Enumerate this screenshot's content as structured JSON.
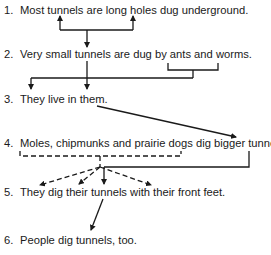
{
  "sentences": [
    {
      "number": "1.",
      "text": "Most tunnels are long holes dug underground."
    },
    {
      "number": "2.",
      "text": "Very small tunnels are dug by ants and worms."
    },
    {
      "number": "3.",
      "text": "They live in them."
    },
    {
      "number": "4.",
      "text": "Moles, chipmunks and prairie dogs dig bigger tunnels."
    },
    {
      "number": "5.",
      "text": "They dig their tunnels with their front feet."
    },
    {
      "number": "6.",
      "text": "People dig tunnels, too."
    }
  ],
  "colors": {
    "line": "#1a1a1a",
    "text": "#1a1a1a",
    "background": "#ffffff"
  }
}
